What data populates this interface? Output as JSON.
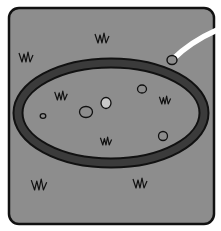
{
  "illustration": {
    "subject": "cartoon panel of a crater ring on grassy ground with a falling meteor streak",
    "colors": {
      "background": "#ffffff",
      "panel_fill": "#8d8d8d",
      "outline": "#111111",
      "ring_fill": "#3b3b3b",
      "streak": "#ffffff",
      "pebble_fill": "#8d8d8d",
      "pebble_light": "#c9c9c9"
    },
    "panel": {
      "x": 9,
      "y": 8,
      "width": 205,
      "height": 216,
      "radius": 10
    },
    "ring": {
      "cx": 111,
      "cy": 113,
      "rx": 93,
      "ry": 50,
      "thickness": 8
    },
    "meteor": {
      "streak_path": "M 172 60 Q 190 42 217 30",
      "rock": {
        "cx": 172,
        "cy": 60,
        "rx": 5,
        "ry": 4.5
      }
    },
    "pebbles": [
      {
        "cx": 43,
        "cy": 116,
        "rx": 2.8,
        "ry": 2.3,
        "light": false
      },
      {
        "cx": 86,
        "cy": 112,
        "rx": 6.5,
        "ry": 5.5,
        "light": false
      },
      {
        "cx": 106,
        "cy": 103,
        "rx": 5,
        "ry": 5.5,
        "light": true
      },
      {
        "cx": 142,
        "cy": 89,
        "rx": 4.5,
        "ry": 4,
        "light": false
      },
      {
        "cx": 163,
        "cy": 136,
        "rx": 4.5,
        "ry": 4.5,
        "light": false
      }
    ],
    "grass_tufts": [
      {
        "x": 26,
        "y": 62,
        "scale": 1.0
      },
      {
        "x": 102,
        "y": 43,
        "scale": 1.0
      },
      {
        "x": 61,
        "y": 100,
        "scale": 0.9
      },
      {
        "x": 165,
        "y": 104,
        "scale": 0.8
      },
      {
        "x": 106,
        "y": 145,
        "scale": 0.8
      },
      {
        "x": 39,
        "y": 190,
        "scale": 1.1
      },
      {
        "x": 140,
        "y": 188,
        "scale": 1.0
      }
    ]
  }
}
